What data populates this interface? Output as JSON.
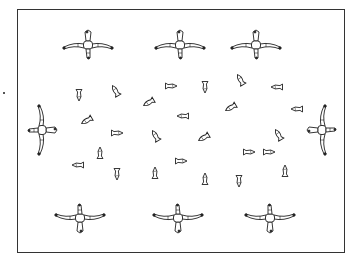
{
  "diagram": {
    "type": "pond-layout",
    "frame": {
      "x": 17,
      "y": 9,
      "w": 328,
      "h": 244,
      "stroke": "#333333"
    },
    "figures": [
      {
        "id": "figure-top-1",
        "x": 88,
        "y": 45,
        "rot": 0
      },
      {
        "id": "figure-top-2",
        "x": 180,
        "y": 45,
        "rot": 0
      },
      {
        "id": "figure-top-3",
        "x": 256,
        "y": 45,
        "rot": 0
      },
      {
        "id": "figure-left",
        "x": 42,
        "y": 130,
        "rot": 90
      },
      {
        "id": "figure-right",
        "x": 322,
        "y": 130,
        "rot": -90
      },
      {
        "id": "figure-bottom-1",
        "x": 80,
        "y": 218,
        "rot": 180
      },
      {
        "id": "figure-bottom-2",
        "x": 178,
        "y": 218,
        "rot": 180
      },
      {
        "id": "figure-bottom-3",
        "x": 270,
        "y": 218,
        "rot": 180
      }
    ],
    "fish": [
      {
        "x": 79,
        "y": 96,
        "rot": -90
      },
      {
        "x": 115,
        "y": 90,
        "rot": 60
      },
      {
        "x": 148,
        "y": 103,
        "rot": -30
      },
      {
        "x": 172,
        "y": 86,
        "rot": 180
      },
      {
        "x": 205,
        "y": 88,
        "rot": -90
      },
      {
        "x": 240,
        "y": 79,
        "rot": 60
      },
      {
        "x": 276,
        "y": 87,
        "rot": 0
      },
      {
        "x": 86,
        "y": 121,
        "rot": -30
      },
      {
        "x": 182,
        "y": 116,
        "rot": 0
      },
      {
        "x": 230,
        "y": 108,
        "rot": -30
      },
      {
        "x": 296,
        "y": 109,
        "rot": 0
      },
      {
        "x": 118,
        "y": 133,
        "rot": 180
      },
      {
        "x": 155,
        "y": 135,
        "rot": 60
      },
      {
        "x": 203,
        "y": 138,
        "rot": -30
      },
      {
        "x": 278,
        "y": 134,
        "rot": 60
      },
      {
        "x": 77,
        "y": 165,
        "rot": 0
      },
      {
        "x": 100,
        "y": 152,
        "rot": 90
      },
      {
        "x": 182,
        "y": 161,
        "rot": 180
      },
      {
        "x": 250,
        "y": 152,
        "rot": 180
      },
      {
        "x": 285,
        "y": 170,
        "rot": 90
      },
      {
        "x": 117,
        "y": 175,
        "rot": -90
      },
      {
        "x": 155,
        "y": 172,
        "rot": 90
      },
      {
        "x": 205,
        "y": 178,
        "rot": 90
      },
      {
        "x": 239,
        "y": 182,
        "rot": -90
      },
      {
        "x": 270,
        "y": 152,
        "rot": 180
      }
    ]
  }
}
